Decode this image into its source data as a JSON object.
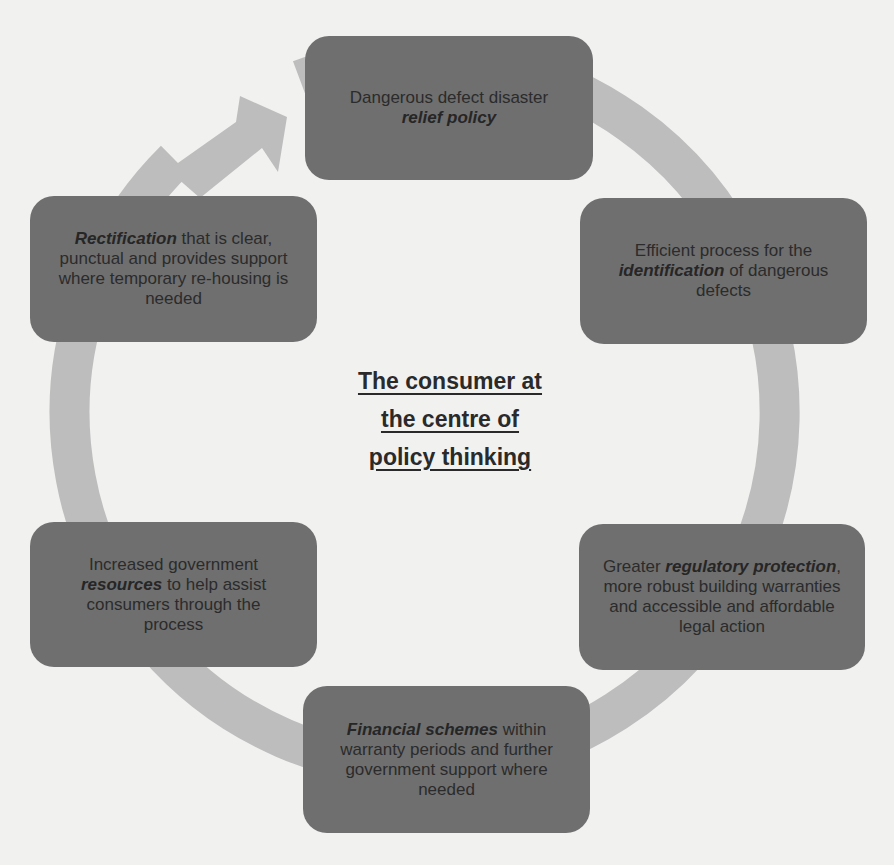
{
  "diagram": {
    "type": "cycle",
    "center_title": {
      "lines": [
        "The consumer at",
        "the centre of",
        "policy thinking"
      ]
    },
    "colors": {
      "box_fill": "#6f6f6f",
      "ring": "#bdbdbd",
      "background": "#f1f1f0",
      "text": "#2b2b2b"
    },
    "nodes": [
      {
        "position": "top",
        "parts": [
          {
            "text": "Dangerous defect disaster",
            "emphasis": false
          },
          {
            "text": "relief policy",
            "emphasis": true
          }
        ]
      },
      {
        "position": "upper-right",
        "parts": [
          {
            "text": "Efficient process for the",
            "emphasis": false
          },
          {
            "text": "identification",
            "emphasis": true
          },
          {
            "text": " of dangerous defects",
            "emphasis": false
          }
        ]
      },
      {
        "position": "lower-right",
        "parts": [
          {
            "text": "Greater ",
            "emphasis": false
          },
          {
            "text": "regulatory protection",
            "emphasis": true
          },
          {
            "text": ", more robust building warranties and accessible and affordable legal action",
            "emphasis": false
          }
        ]
      },
      {
        "position": "bottom",
        "parts": [
          {
            "text": "Financial schemes",
            "emphasis": true
          },
          {
            "text": " within warranty periods and further government support where needed",
            "emphasis": false
          }
        ]
      },
      {
        "position": "lower-left",
        "parts": [
          {
            "text": "Increased government ",
            "emphasis": false
          },
          {
            "text": "resources",
            "emphasis": true
          },
          {
            "text": " to help assist consumers through the process",
            "emphasis": false
          }
        ]
      },
      {
        "position": "upper-left",
        "parts": [
          {
            "text": "Rectification",
            "emphasis": true
          },
          {
            "text": " that is clear, punctual and provides support where temporary re-housing is needed",
            "emphasis": false
          }
        ]
      }
    ],
    "arrow": {
      "direction": "clockwise",
      "head_position": "top-left, pointing to top node"
    }
  }
}
